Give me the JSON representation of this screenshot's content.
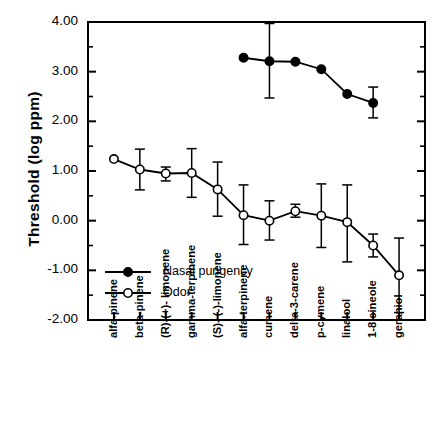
{
  "chart_data": {
    "type": "line",
    "title": "",
    "xlabel": "",
    "ylabel": "Threshold  (log  ppm)",
    "ylim": [
      -2.0,
      4.0
    ],
    "ytick_labels": [
      "4.00",
      "3.00",
      "2.00",
      "1.00",
      "0.00",
      "-1.00",
      "-2.00"
    ],
    "ytick_values": [
      4.0,
      3.0,
      2.0,
      1.0,
      0.0,
      -1.0,
      -2.0
    ],
    "minor_tick_step": 0.5,
    "grid": false,
    "legend_position": "lower-left-inside",
    "categories": [
      "alfa-pinene",
      "beta-pinene",
      "(R)-(+)- limonene",
      "gamma-terpinene",
      "(S)- (-)-limonene",
      "alfa-terpinene",
      "cumene",
      "delta-3-carene",
      "p-cymene",
      "linalool",
      "1-8 cineole",
      "geraniol"
    ],
    "series": [
      {
        "name": "Nasal pungency",
        "marker": "filled-circle",
        "color": "#000000",
        "values": [
          null,
          null,
          null,
          null,
          null,
          3.28,
          3.21,
          3.2,
          3.05,
          2.55,
          2.37,
          null
        ],
        "err_low": [
          null,
          null,
          null,
          null,
          null,
          3.28,
          2.47,
          3.2,
          3.05,
          2.55,
          2.07,
          null
        ],
        "err_high": [
          null,
          null,
          null,
          null,
          null,
          3.28,
          3.97,
          3.2,
          3.05,
          2.55,
          2.69,
          null
        ]
      },
      {
        "name": "Odor",
        "marker": "open-circle",
        "color": "#000000",
        "values": [
          1.24,
          1.03,
          0.95,
          0.96,
          0.63,
          0.11,
          0.0,
          0.19,
          0.1,
          -0.03,
          -0.5,
          -1.1
        ],
        "err_low": [
          1.24,
          0.62,
          0.8,
          0.47,
          0.09,
          -0.48,
          -0.39,
          0.07,
          -0.54,
          -0.83,
          -0.73,
          -1.85
        ],
        "err_high": [
          1.24,
          1.44,
          1.08,
          1.45,
          1.18,
          0.72,
          0.4,
          0.33,
          0.74,
          0.72,
          -0.27,
          -0.35
        ]
      }
    ]
  },
  "legend": {
    "entries": [
      {
        "label": "Nasal pungency",
        "marker": "filled-circle"
      },
      {
        "label": "Odor",
        "marker": "open-circle"
      }
    ]
  }
}
